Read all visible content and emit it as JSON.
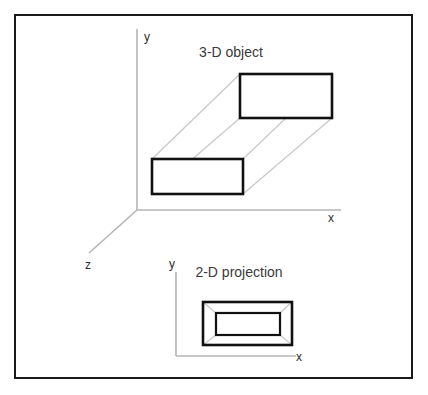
{
  "figure": {
    "border": {
      "color": "#1a1a1a",
      "x": 15,
      "y": 15,
      "width": 397,
      "height": 363,
      "stroke_width": 2
    },
    "background_color": "#ffffff",
    "axis_color": "#b5b5b5",
    "solid_shape_color": "#111111",
    "projector_line_color": "#c9c9c9"
  },
  "scene_3d": {
    "caption": "3-D object",
    "caption_x": 231,
    "caption_y": 57,
    "origin": {
      "x": 137,
      "y": 210
    },
    "axes": [
      {
        "name": "y-axis",
        "label": "y",
        "label_x": 147,
        "label_y": 41,
        "x1": 137,
        "y1": 210,
        "x2": 137,
        "y2": 29
      },
      {
        "name": "x-axis",
        "label": "x",
        "label_x": 331,
        "label_y": 222,
        "x1": 137,
        "y1": 210,
        "x2": 341,
        "y2": 210
      },
      {
        "name": "z-axis",
        "label": "z",
        "label_x": 88,
        "label_y": 269,
        "x1": 137,
        "y1": 210,
        "x2": 89,
        "y2": 253
      }
    ],
    "front_face": {
      "x": 152,
      "y": 159,
      "width": 91,
      "height": 35
    },
    "back_face": {
      "x": 240,
      "y": 74,
      "width": 92,
      "height": 44
    },
    "connector_count": 4
  },
  "scene_2d": {
    "caption": "2-D projection",
    "caption_x": 239,
    "caption_y": 277,
    "origin": {
      "x": 176,
      "y": 356
    },
    "axes": [
      {
        "name": "y-axis",
        "label": "y",
        "label_x": 172,
        "label_y": 268,
        "x1": 176,
        "y1": 356,
        "x2": 176,
        "y2": 272
      },
      {
        "name": "x-axis",
        "label": "x",
        "label_x": 299,
        "label_y": 361,
        "x1": 176,
        "y1": 356,
        "x2": 296,
        "y2": 356
      }
    ],
    "outer_face": {
      "x": 203,
      "y": 302,
      "width": 89,
      "height": 43
    },
    "inner_face": {
      "x": 216,
      "y": 313,
      "width": 64,
      "height": 22
    },
    "corner_connector_count": 4
  }
}
